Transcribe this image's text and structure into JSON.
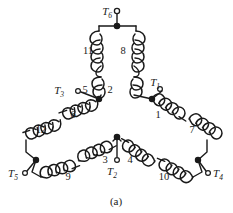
{
  "figure": {
    "caption": "(a)",
    "stroke_color": "#1a1a1a",
    "text_color": "#1a1a1a",
    "background": "#ffffff"
  },
  "terminals": [
    {
      "id": "T1",
      "base": "T",
      "sub": "1",
      "label": "T₁",
      "x": 168,
      "y": 88,
      "node_x": 152,
      "node_y": 99,
      "dot_x": 159,
      "dot_y": 93
    },
    {
      "id": "T2",
      "base": "T",
      "sub": "2",
      "label": "T₂",
      "x": 112,
      "y": 172,
      "node_x": 117,
      "node_y": 137,
      "dot_x": 117,
      "dot_y": 160
    },
    {
      "id": "T3",
      "base": "T",
      "sub": "3",
      "label": "T₃",
      "x": 62,
      "y": 88,
      "node_x": 99,
      "node_y": 99,
      "dot_x": 78,
      "dot_y": 93
    },
    {
      "id": "T4",
      "base": "T",
      "sub": "4",
      "label": "T₄",
      "x": 215,
      "y": 172,
      "node_x": 198,
      "node_y": 160,
      "dot_x": 207,
      "dot_y": 170
    },
    {
      "id": "T5",
      "base": "T",
      "sub": "5",
      "label": "T₅",
      "x": 12,
      "y": 172,
      "node_x": 36,
      "node_y": 160,
      "dot_x": 25,
      "dot_y": 170
    },
    {
      "id": "T6",
      "base": "T",
      "sub": "6",
      "label": "T₆",
      "x": 104,
      "y": 12,
      "node_x": 117,
      "node_y": 26,
      "dot_x": 117,
      "dot_y": 11
    }
  ],
  "coils": [
    {
      "number": "1",
      "label_x": 158,
      "label_y": 118,
      "branch": "right-upper"
    },
    {
      "number": "2",
      "label_x": 108,
      "label_y": 92,
      "branch": "top-right-lower"
    },
    {
      "number": "3",
      "label_x": 106,
      "label_y": 161,
      "branch": "bottom-left-inner"
    },
    {
      "number": "4",
      "label_x": 129,
      "label_y": 161,
      "branch": "bottom-right-inner"
    },
    {
      "number": "5",
      "label_x": 84,
      "label_y": 92,
      "branch": "top-left-lower"
    },
    {
      "number": "6",
      "label_x": 72,
      "label_y": 118,
      "branch": "left-upper"
    },
    {
      "number": "7",
      "label_x": 192,
      "label_y": 132,
      "branch": "right-lower"
    },
    {
      "number": "8",
      "label_x": 121,
      "label_y": 52,
      "branch": "top-right-upper"
    },
    {
      "number": "9",
      "label_x": 68,
      "label_y": 175,
      "branch": "bottom-left-outer"
    },
    {
      "number": "10",
      "label_x": 162,
      "label_y": 175,
      "branch": "bottom-right-outer"
    },
    {
      "number": "11",
      "label_x": 88,
      "label_y": 52,
      "branch": "top-left-upper"
    },
    {
      "number": "12",
      "label_x": 40,
      "label_y": 132,
      "branch": "left-lower"
    }
  ],
  "junctions": [
    {
      "name": "top-node",
      "x": 117,
      "y": 26
    },
    {
      "name": "left-node",
      "x": 99,
      "y": 99
    },
    {
      "name": "right-node",
      "x": 152,
      "y": 99
    },
    {
      "name": "bottom-apex",
      "x": 117,
      "y": 137
    },
    {
      "name": "left-corner",
      "x": 36,
      "y": 160
    },
    {
      "name": "right-corner",
      "x": 198,
      "y": 160
    }
  ]
}
